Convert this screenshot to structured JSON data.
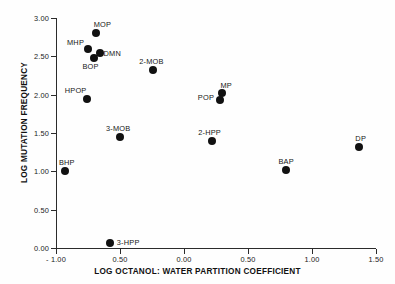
{
  "chart_data": {
    "type": "scatter",
    "title": "",
    "xlabel": "LOG OCTANOL: WATER PARTITION COEFFICIENT",
    "ylabel": "LOG MUTATION FREQUENCY",
    "xlim": [
      -1.0,
      1.5
    ],
    "ylim": [
      0.0,
      3.0
    ],
    "grid": false,
    "legend": "none",
    "xticks": [
      "- 1.00",
      "0.50",
      "0.00",
      "0.50",
      "1.00",
      "1.50"
    ],
    "xtick_values": [
      -1.0,
      -0.5,
      0.0,
      0.5,
      1.0,
      1.5
    ],
    "yticks": [
      "0.00",
      "0.50",
      "1.00",
      "1.50",
      "2.00",
      "2.50",
      "3.00"
    ],
    "ytick_values": [
      0.0,
      0.5,
      1.0,
      1.5,
      2.0,
      2.5,
      3.0
    ],
    "points": [
      {
        "label": "MOP",
        "x": -0.69,
        "y": 2.8,
        "label_dx": -2,
        "label_dy": -13
      },
      {
        "label": "MHP",
        "x": -0.75,
        "y": 2.6,
        "label_dx": -21,
        "label_dy": -11
      },
      {
        "label": "DMN",
        "x": -0.66,
        "y": 2.55,
        "label_dx": 4,
        "label_dy": -4
      },
      {
        "label": "BOP",
        "x": -0.7,
        "y": 2.48,
        "label_dx": -12,
        "label_dy": 4
      },
      {
        "label": "2-MOB",
        "x": -0.24,
        "y": 2.32,
        "label_dx": -14,
        "label_dy": -13
      },
      {
        "label": "HPOP",
        "x": -0.76,
        "y": 1.95,
        "label_dx": -22,
        "label_dy": -13
      },
      {
        "label": "MP",
        "x": 0.3,
        "y": 2.02,
        "label_dx": -2,
        "label_dy": -12
      },
      {
        "label": "POP",
        "x": 0.28,
        "y": 1.93,
        "label_dx": -22,
        "label_dy": -7
      },
      {
        "label": "3-MOB",
        "x": -0.5,
        "y": 1.45,
        "label_dx": -14,
        "label_dy": -13
      },
      {
        "label": "2-HPP",
        "x": 0.22,
        "y": 1.4,
        "label_dx": -14,
        "label_dy": -13
      },
      {
        "label": "BAP",
        "x": 0.8,
        "y": 1.02,
        "label_dx": -8,
        "label_dy": -13
      },
      {
        "label": "DP",
        "x": 1.37,
        "y": 1.32,
        "label_dx": -4,
        "label_dy": -13
      },
      {
        "label": "BHP",
        "x": -0.93,
        "y": 1.0,
        "label_dx": -6,
        "label_dy": -13
      },
      {
        "label": "3-HPP",
        "x": -0.58,
        "y": 0.07,
        "label_dx": 7,
        "label_dy": -5
      }
    ]
  }
}
